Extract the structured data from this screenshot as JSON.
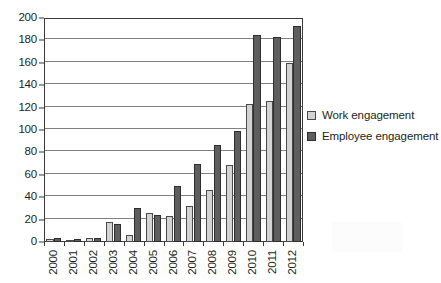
{
  "chart_data": {
    "type": "bar",
    "title": "",
    "xlabel": "",
    "ylabel": "",
    "ylim": [
      0,
      200
    ],
    "ytick_step": 20,
    "yticks": [
      0,
      20,
      40,
      60,
      80,
      100,
      120,
      140,
      160,
      180,
      200
    ],
    "grid": true,
    "legend_position": "right",
    "categories": [
      "2000",
      "2001",
      "2002",
      "2003",
      "2004",
      "2005",
      "2006",
      "2007",
      "2008",
      "2009",
      "2010",
      "2011",
      "2012"
    ],
    "series": [
      {
        "name": "Work engagement",
        "color": "#d3d3d3",
        "values": [
          3,
          2,
          4,
          18,
          6,
          26,
          23,
          32,
          46,
          69,
          123,
          126,
          160
        ]
      },
      {
        "name": "Employee engagement",
        "color": "#5e5e5e",
        "values": [
          4,
          3,
          4,
          16,
          30,
          24,
          50,
          70,
          87,
          99,
          185,
          183,
          193
        ]
      }
    ]
  },
  "legend": {
    "items": [
      {
        "label": "Work engagement",
        "swatch": "light-square-swatch"
      },
      {
        "label": "Employee engagement",
        "swatch": "dark-square-swatch"
      }
    ]
  },
  "colors": {
    "series_light": "#d3d3d3",
    "series_dark": "#5e5e5e",
    "axis": "#3a3a3a",
    "gridline": "#808080",
    "text": "#231f20",
    "background": "#ffffff"
  }
}
